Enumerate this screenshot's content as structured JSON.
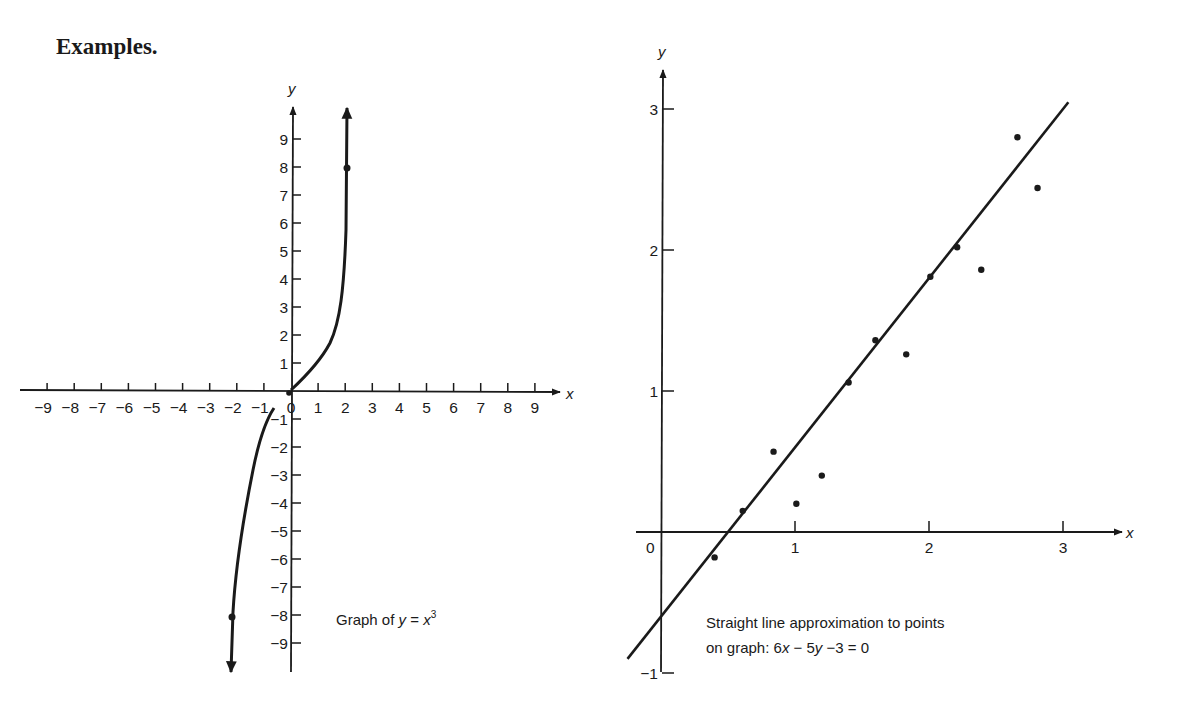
{
  "heading": "Examples.",
  "colors": {
    "ink": "#1a1a1a",
    "background": "#ffffff"
  },
  "chart_data": [
    {
      "type": "line",
      "title": "Graph of y = x³",
      "caption": {
        "prefix": "Graph of ",
        "var_y": "y",
        "equals": " = ",
        "var_x": "x",
        "exponent": "3"
      },
      "function": "y = x^3",
      "xlabel": "x",
      "ylabel": "y",
      "xlim": [
        -9,
        9
      ],
      "ylim": [
        -9,
        9
      ],
      "grid": false,
      "x_ticks": [
        -9,
        -8,
        -7,
        -6,
        -5,
        -4,
        -3,
        -2,
        -1,
        0,
        1,
        2,
        3,
        4,
        5,
        6,
        7,
        8,
        9
      ],
      "x_tick_labels": [
        "−9",
        "−8",
        "−7",
        "−6",
        "−5",
        "−4",
        "−3",
        "−2",
        "−1",
        "0",
        "1",
        "2",
        "3",
        "4",
        "5",
        "6",
        "7",
        "8",
        "9"
      ],
      "y_ticks": [
        9,
        8,
        7,
        6,
        5,
        4,
        3,
        2,
        1,
        -1,
        -2,
        -3,
        -4,
        -5,
        -6,
        -7,
        -8,
        -9
      ],
      "y_tick_labels": [
        "9",
        "8",
        "7",
        "6",
        "5",
        "4",
        "3",
        "2",
        "1",
        "−1",
        "−2",
        "−3",
        "−4",
        "−5",
        "−6",
        "−7",
        "−8",
        "−9"
      ],
      "x": [
        -2.15,
        -2,
        -1.8,
        -1.5,
        -1.2,
        -1,
        -0.6,
        0,
        0.6,
        1,
        1.2,
        1.5,
        1.8,
        2,
        2.15
      ],
      "y": [
        -10,
        -8,
        -5.8,
        -3.4,
        -1.7,
        -1,
        -0.2,
        0,
        0.2,
        1,
        1.7,
        3.4,
        5.8,
        8,
        10
      ],
      "marked_points": [
        {
          "x": 2,
          "y": 8
        },
        {
          "x": -2,
          "y": -8
        },
        {
          "x": 0,
          "y": 0
        }
      ],
      "arrows": "both ends"
    },
    {
      "type": "scatter",
      "title": "Straight line approximation to points on graph: 6x − 5y − 3 = 0",
      "caption": {
        "line1": "Straight line approximation to points",
        "line2_prefix": "on graph:  6",
        "line2_x": "x",
        "line2_mid": " − 5",
        "line2_y": "y",
        "line2_suffix": " −3  =  0"
      },
      "xlabel": "x",
      "ylabel": "y",
      "xlim": [
        -0.2,
        3.4
      ],
      "ylim": [
        -1,
        3.3
      ],
      "grid": false,
      "x_ticks": [
        1,
        2,
        3
      ],
      "x_tick_labels": [
        "1",
        "2",
        "3"
      ],
      "origin_label": "0",
      "y_ticks": [
        3,
        2,
        1,
        -1
      ],
      "y_tick_labels": [
        "3",
        "2",
        "1",
        "−1"
      ],
      "points": [
        {
          "x": 0.4,
          "y": -0.18
        },
        {
          "x": 0.61,
          "y": 0.15
        },
        {
          "x": 0.84,
          "y": 0.57
        },
        {
          "x": 1.01,
          "y": 0.2
        },
        {
          "x": 1.2,
          "y": 0.4
        },
        {
          "x": 1.4,
          "y": 1.06
        },
        {
          "x": 1.6,
          "y": 1.36
        },
        {
          "x": 1.83,
          "y": 1.26
        },
        {
          "x": 2.01,
          "y": 1.81
        },
        {
          "x": 2.21,
          "y": 2.02
        },
        {
          "x": 2.39,
          "y": 1.86
        },
        {
          "x": 2.66,
          "y": 2.8
        },
        {
          "x": 2.81,
          "y": 2.44
        }
      ],
      "fit_line": {
        "equation": "6x − 5y − 3 = 0",
        "slope": 1.2,
        "intercept": -0.6,
        "x_range": [
          -0.25,
          3.04
        ]
      }
    }
  ]
}
